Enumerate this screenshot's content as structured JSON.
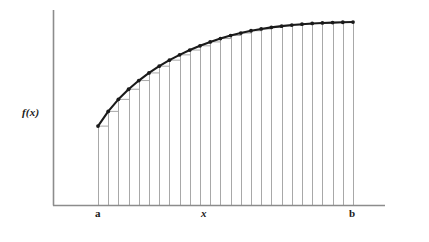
{
  "figure": {
    "background_color": "#ffffff",
    "axis_color": "#8c8c8c",
    "curve_color": "#1a1a1a",
    "partition_color": "#a8a8a8",
    "marker_color": "#1a1a1a"
  },
  "labels": {
    "y_axis": "f(x)",
    "x_axis": "x",
    "lower_limit": "a",
    "upper_limit": "b"
  },
  "chart_data": {
    "type": "line",
    "title": "",
    "subtitle": "",
    "xlabel": "x",
    "ylabel": "f(x)",
    "grid": false,
    "legend": null,
    "annotations": [
      {
        "text": "a",
        "x": 0.0,
        "position": "x-axis-tick",
        "role": "lower-limit-of-integration"
      },
      {
        "text": "b",
        "x": 25.0,
        "position": "x-axis-tick",
        "role": "upper-limit-of-integration"
      },
      {
        "text": "x",
        "x": 12.5,
        "position": "x-axis-center",
        "role": "axis-name"
      },
      {
        "text": "f(x)",
        "y": 0.46,
        "position": "y-axis-center",
        "role": "axis-name"
      }
    ],
    "axis_ranges": {
      "x_axis_pixel": [
        53,
        385
      ],
      "y_axis_pixel": [
        10,
        205
      ],
      "interval_pixel": [
        98,
        353
      ]
    },
    "n_partitions": 25,
    "n_ordinates": 26,
    "x": [
      0,
      1,
      2,
      3,
      4,
      5,
      6,
      7,
      8,
      9,
      10,
      11,
      12,
      13,
      14,
      15,
      16,
      17,
      18,
      19,
      20,
      21,
      22,
      23,
      24,
      25
    ],
    "series": [
      {
        "name": "f(x)",
        "marker": "filled-circle",
        "values": [
          0.445,
          0.528,
          0.596,
          0.653,
          0.702,
          0.745,
          0.783,
          0.817,
          0.847,
          0.874,
          0.898,
          0.92,
          0.939,
          0.956,
          0.97,
          0.983,
          0.993,
          1.002,
          1.009,
          1.015,
          1.02,
          1.024,
          1.027,
          1.029,
          1.031,
          1.032
        ]
      }
    ],
    "ylim": [
      0,
      1.1
    ],
    "xlim": [
      0,
      25
    ]
  }
}
